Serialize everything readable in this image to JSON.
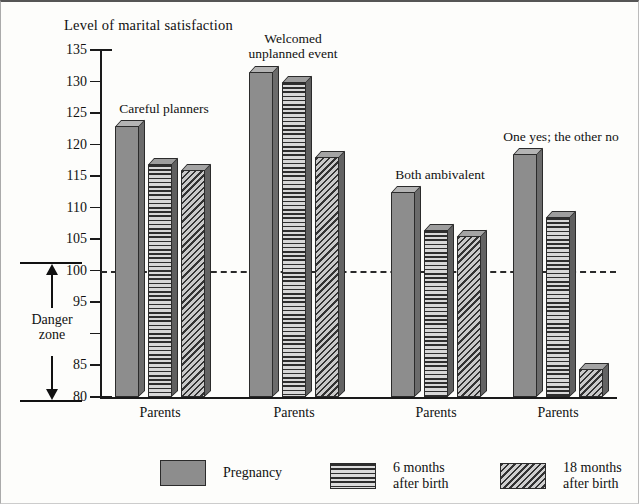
{
  "chart_data": {
    "type": "bar",
    "title": "Level of marital satisfaction",
    "xlabel": "",
    "ylabel": "Level of marital satisfaction",
    "ylim": [
      80,
      135
    ],
    "ytick_step": 5,
    "yticks": [
      135,
      130,
      125,
      120,
      115,
      110,
      105,
      100,
      95,
      90,
      85,
      80
    ],
    "grid": false,
    "legend_position": "bottom",
    "reference_line": {
      "value": 100,
      "style": "dashed",
      "label": ""
    },
    "annotation": {
      "label": "Danger\nzone",
      "from": 80,
      "to": 100
    },
    "categories": [
      "Parents",
      "Parents",
      "Parents",
      "Parents"
    ],
    "group_labels": [
      "Careful planners",
      "Welcomed\nunplanned event",
      "Both ambivalent",
      "One yes; the other no"
    ],
    "series": [
      {
        "name": "Pregnancy",
        "fill": "solid",
        "values": [
          123,
          131.5,
          112.5,
          118.5
        ]
      },
      {
        "name": "6 months\nafter birth",
        "fill": "hlines",
        "values": [
          117,
          130,
          106.5,
          108.5
        ]
      },
      {
        "name": "18 months\nafter birth",
        "fill": "diag",
        "values": [
          116,
          118,
          105.5,
          84.5
        ]
      }
    ]
  },
  "legend": {
    "items": [
      {
        "label": "Pregnancy",
        "fill": "solid"
      },
      {
        "label": "6 months\nafter birth",
        "fill": "hlines"
      },
      {
        "label": "18 months\nafter birth",
        "fill": "diag"
      }
    ]
  },
  "colors": {
    "bar_solid": "#8d8d8d",
    "bar_stripe_dark": "#2e2e2e",
    "bar_stripe_light": "#d8d8d8",
    "axis": "#1a1a1a",
    "text": "#111111",
    "background": "#fdfdfb"
  }
}
